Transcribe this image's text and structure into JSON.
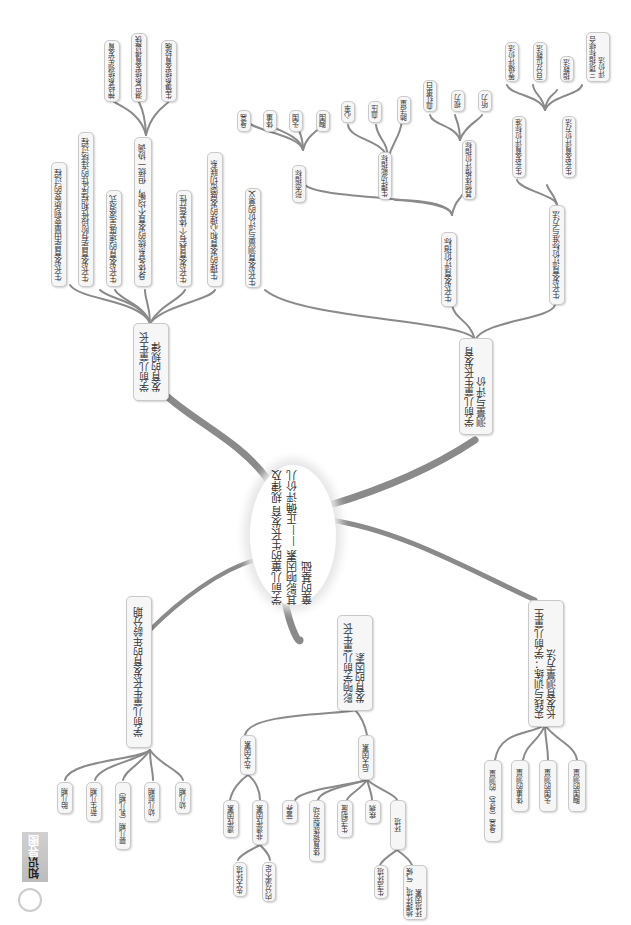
{
  "center": {
    "label": "学前儿童的生长发育\n规律及其影响因素\n——正确评价儿童的基础"
  },
  "banner": {
    "label_dark": "知识",
    "label_light": "导图",
    "icon": "lightbulb-icon"
  },
  "branches": {
    "laws": {
      "label": "学前儿童生长\n发育的规律",
      "children": [
        "生长发育是由量变到质变的过程",
        "生长发育是有阶段性和程序性的连续过程",
        "生长发育的速度呈波浪式",
        "身体各系统的发育不均衡，但统一协调",
        "生长发育具有个体差异性",
        "生理的发育和心理的发展密切联系"
      ],
      "systems": [
        "神经系统领先发育",
        "淋巴系统发育得最快",
        "生殖系统发育较晚"
      ]
    },
    "measure": {
      "label": "学前儿童生长发育\n测量与评价",
      "significance": "生长发育测量与评价的意义",
      "indicators": {
        "label": "生长发育评价指标",
        "morph": {
          "label": "形态指标",
          "items": [
            "身高",
            "体重",
            "头围",
            "胸围"
          ]
        },
        "func": {
          "label": "生理功能指标",
          "items": [
            "心率",
            "血压",
            "肺活量"
          ]
        },
        "other": {
          "label": "其他体格评价指标",
          "items": [
            "血红蛋白",
            "视力",
            "听力"
          ]
        }
      },
      "methods": {
        "label": "生长发育评价标准与方法",
        "standard": "生长发育评价标准",
        "method": {
          "label": "生长发育评价方法",
          "items": [
            "等级评价法",
            "百分位数法",
            "指数法",
            "三项指标综合\n评价法"
          ]
        }
      }
    },
    "periods": {
      "label": "学前儿童生长发育的年龄分期",
      "items": [
        "胎儿期",
        "新生儿期",
        "婴儿期（乳儿期）",
        "幼儿前期",
        "幼儿期"
      ]
    },
    "factors": {
      "label": "影响学前儿童生长\n发育的因素",
      "innate": {
        "label": "先天因素",
        "genetic": "遗传因素",
        "nongenetic": {
          "label": "非遗传因素",
          "items": [
            "先天环境",
            "内分泌不足"
          ]
        }
      },
      "acquired": {
        "label": "后天因素",
        "items": [
          "营养",
          "体育锻炼和劳动",
          "生活制度",
          "疾病"
        ],
        "env": {
          "label": "环境",
          "items": [
            "生活环境",
            "地理环境、气候\n环境因素"
          ]
        }
      }
    },
    "practice": {
      "label": "实践与训练：学前儿童生\n长发育测量方法",
      "items": [
        "身高（身长）的测量",
        "体重的测量",
        "头围的测量",
        "胸围的测量"
      ]
    }
  },
  "colors": {
    "line": "#8a8a8a",
    "node_bg": "#f6f6f6",
    "node_border": "#c9c9c9",
    "text": "#333333"
  }
}
